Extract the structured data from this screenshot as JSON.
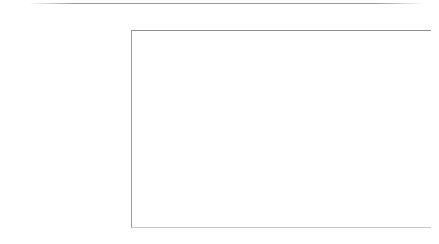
{
  "chart_data": {
    "type": "bar",
    "orientation": "horizontal",
    "title": "",
    "subtitle": "",
    "xlabel": "",
    "ylabel": "",
    "xlim": [
      0,
      65
    ],
    "grid": true,
    "legend": false,
    "axis_tick_labels": [
      "0,0%",
      "10,0%",
      "20,0%",
      "30,0%",
      "40,0%",
      "50,0%",
      "60,0%"
    ],
    "axis_tick_values": [
      0,
      10,
      20,
      30,
      40,
      50,
      60
    ],
    "value_suffix": "%",
    "categories": [
      "Intelligente Lichter",
      "Smart Speaker",
      "Multiroom-Unterhaltungssysteme (z. B. Lautsprecher)",
      "Intelligente Thermostate",
      "Intelligente Klimaanlage oder Heizkörper",
      "Intelligente Geräte (z. B. Kühlschrank)",
      "Sicherheitskameras",
      "Fenster-/Türsensoren",
      "Digitale Türschlösser",
      "Sonstige",
      "Nichts davon"
    ],
    "category_lines": [
      [
        "Intelligente Lichter"
      ],
      [
        "Smart Speaker"
      ],
      [
        "Multiroom-Unterhaltungssysteme",
        "(z. B. Lautsprecher)"
      ],
      [
        "Intelligente Thermostate"
      ],
      [
        "Intelligente Klimaanlage oder",
        "Heizkörper"
      ],
      [
        "Intelligente Geräte (z. B.",
        "Kühlschrank)"
      ],
      [
        "Sicherheitskameras"
      ],
      [
        "Fenster-/Türsensoren"
      ],
      [
        "Digitale Türschlösser"
      ],
      [
        "Sonstige"
      ],
      [
        "Nichts davon"
      ]
    ],
    "values": [
      63,
      38,
      38,
      30,
      26,
      20,
      14,
      12,
      11,
      3,
      1
    ],
    "value_labels": [
      "63%",
      "38%",
      "38%",
      "30%",
      "26%",
      "20%",
      "14%",
      "12%",
      "11%",
      "3%",
      "1%"
    ],
    "colors": {
      "bar": "#4b4b4b",
      "text": "#3a3a3a",
      "gridline": "#d6d6d6",
      "axis": "#8f8f8f",
      "background": "#ffffff"
    }
  }
}
